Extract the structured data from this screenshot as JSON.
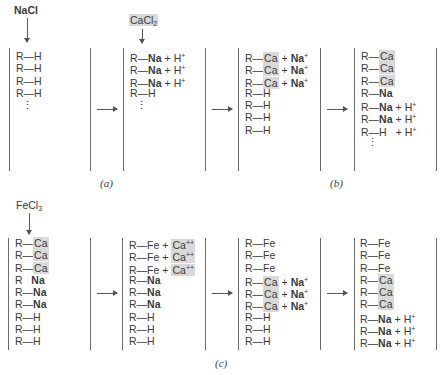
{
  "reagents": {
    "a": {
      "base": "NaCl",
      "sub": ""
    },
    "b": {
      "base": "CaCl",
      "sub": "2"
    },
    "c": {
      "base": "FeCl",
      "sub": "3"
    }
  },
  "captions": {
    "a": "(a)",
    "b": "(b)",
    "c": "(c)"
  },
  "symbols": {
    "arrow": "→",
    "dash": "—",
    "plus": "+",
    "vdots": "⋮"
  },
  "top_row": {
    "col1": [
      {
        "r": "R",
        "g": "H"
      },
      {
        "r": "R",
        "g": "H"
      },
      {
        "r": "R",
        "g": "H"
      },
      {
        "r": "R",
        "g": "H"
      }
    ],
    "col2": [
      {
        "r": "R",
        "g": "Na",
        "ion": "H",
        "charge": "+"
      },
      {
        "r": "R",
        "g": "Na",
        "ion": "H",
        "charge": "+"
      },
      {
        "r": "R",
        "g": "Na",
        "ion": "H",
        "charge": "+"
      },
      {
        "r": "R",
        "g": "H"
      }
    ],
    "col3": [
      {
        "r": "R",
        "g": "Ca",
        "ion": "Na",
        "charge": "+"
      },
      {
        "r": "R",
        "g": "Ca",
        "ion": "Na",
        "charge": "+"
      },
      {
        "r": "R",
        "g": "Ca",
        "ion": "Na",
        "charge": "+"
      },
      {
        "r": "R",
        "g": "H"
      },
      {
        "r": "R",
        "g": "H"
      },
      {
        "r": "R",
        "g": "H"
      },
      {
        "r": "R",
        "g": "H"
      }
    ],
    "col4": [
      {
        "r": "R",
        "g": "Ca"
      },
      {
        "r": "R",
        "g": "Ca"
      },
      {
        "r": "R",
        "g": "Ca"
      },
      {
        "r": "R",
        "g": "Na"
      },
      {
        "r": "R",
        "g": "Na",
        "ion": "H",
        "charge": "+"
      },
      {
        "r": "R",
        "g": "Na",
        "ion": "H",
        "charge": "+"
      },
      {
        "r": "R",
        "g": "H",
        "ion": "H",
        "charge": "+"
      }
    ]
  },
  "bottom_row": {
    "col1": [
      {
        "r": "R",
        "g": "Ca"
      },
      {
        "r": "R",
        "g": "Ca"
      },
      {
        "r": "R",
        "g": "Ca"
      },
      {
        "r": "R",
        "g": "Na"
      },
      {
        "r": "R",
        "g": "Na"
      },
      {
        "r": "R",
        "g": "Na"
      },
      {
        "r": "R",
        "g": "H"
      },
      {
        "r": "R",
        "g": "H"
      },
      {
        "r": "R",
        "g": "H"
      }
    ],
    "col2": [
      {
        "r": "R",
        "g": "Fe",
        "ion": "Ca",
        "charge": "++"
      },
      {
        "r": "R",
        "g": "Fe",
        "ion": "Ca",
        "charge": "++"
      },
      {
        "r": "R",
        "g": "Fe",
        "ion": "Ca",
        "charge": "++"
      },
      {
        "r": "R",
        "g": "Na"
      },
      {
        "r": "R",
        "g": "Na"
      },
      {
        "r": "R",
        "g": "Na"
      },
      {
        "r": "R",
        "g": "H"
      },
      {
        "r": "R",
        "g": "H"
      },
      {
        "r": "R",
        "g": "H"
      }
    ],
    "col3": [
      {
        "r": "R",
        "g": "Fe"
      },
      {
        "r": "R",
        "g": "Fe"
      },
      {
        "r": "R",
        "g": "Fe"
      },
      {
        "r": "R",
        "g": "Ca",
        "ion": "Na",
        "charge": "+"
      },
      {
        "r": "R",
        "g": "Ca",
        "ion": "Na",
        "charge": "+"
      },
      {
        "r": "R",
        "g": "Ca",
        "ion": "Na",
        "charge": "+"
      },
      {
        "r": "R",
        "g": "H"
      },
      {
        "r": "R",
        "g": "H"
      },
      {
        "r": "R",
        "g": "H"
      }
    ],
    "col4": [
      {
        "r": "R",
        "g": "Fe"
      },
      {
        "r": "R",
        "g": "Fe"
      },
      {
        "r": "R",
        "g": "Fe"
      },
      {
        "r": "R",
        "g": "Ca"
      },
      {
        "r": "R",
        "g": "Ca"
      },
      {
        "r": "R",
        "g": "Ca"
      },
      {
        "r": "R",
        "g": "Na",
        "ion": "H",
        "charge": "+"
      },
      {
        "r": "R",
        "g": "Na",
        "ion": "H",
        "charge": "+"
      },
      {
        "r": "R",
        "g": "Na",
        "ion": "H",
        "charge": "+"
      }
    ]
  }
}
